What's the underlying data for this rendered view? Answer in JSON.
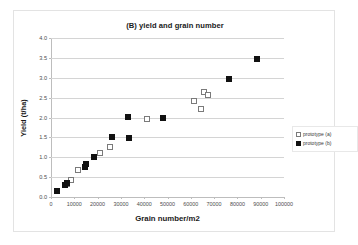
{
  "chart_data": {
    "type": "scatter",
    "title": "(B) yield and grain number",
    "xlabel": "Grain number/m2",
    "ylabel": "Yield (t/ha)",
    "xlim": [
      0,
      100000
    ],
    "ylim": [
      0,
      4.0
    ],
    "xticks": [
      0,
      10000,
      20000,
      30000,
      40000,
      50000,
      60000,
      70000,
      80000,
      90000,
      100000
    ],
    "xtick_labels": [
      "0",
      "10000",
      "20000",
      "30000",
      "40000",
      "50000",
      "60000",
      "70000",
      "80000",
      "90000",
      "100000"
    ],
    "yticks": [
      0.0,
      0.5,
      1.0,
      1.5,
      2.0,
      2.5,
      3.0,
      3.5,
      4.0
    ],
    "ytick_labels": [
      "0.0",
      "0.5",
      "1.0",
      "1.5",
      "2.0",
      "2.5",
      "3.0",
      "3.5",
      "4.0"
    ],
    "grid": "horizontal",
    "legend_position": "right",
    "series": [
      {
        "name": "prototype (a)",
        "marker": "open-square",
        "color": "#7a7a7a",
        "points": [
          [
            7000,
            0.33
          ],
          [
            8500,
            0.42
          ],
          [
            11500,
            0.67
          ],
          [
            21000,
            1.1
          ],
          [
            25500,
            1.25
          ],
          [
            41000,
            1.97
          ],
          [
            61500,
            2.42
          ],
          [
            64500,
            2.22
          ],
          [
            65500,
            2.65
          ],
          [
            67500,
            2.56
          ]
        ]
      },
      {
        "name": "prototype (b)",
        "marker": "filled-square",
        "color": "#111111",
        "points": [
          [
            2500,
            0.16
          ],
          [
            6000,
            0.31
          ],
          [
            7000,
            0.36
          ],
          [
            14500,
            0.75
          ],
          [
            15000,
            0.82
          ],
          [
            18500,
            1.0
          ],
          [
            26000,
            1.51
          ],
          [
            33000,
            2.02
          ],
          [
            33500,
            1.48
          ],
          [
            48000,
            1.99
          ],
          [
            76500,
            2.97
          ],
          [
            88500,
            3.47
          ]
        ]
      }
    ]
  }
}
